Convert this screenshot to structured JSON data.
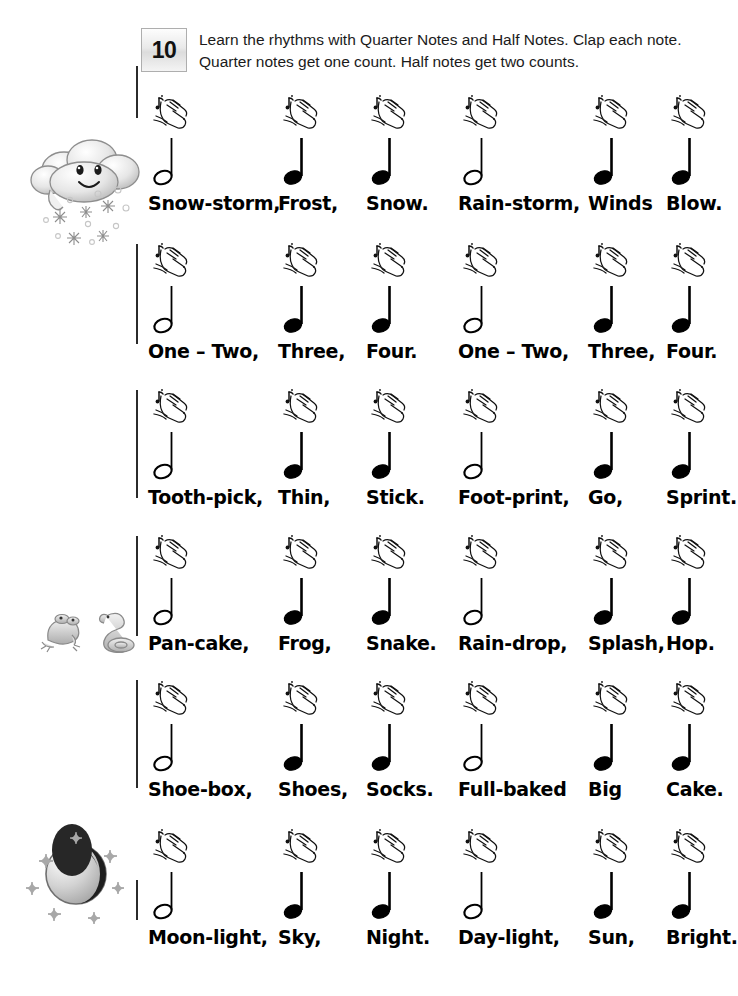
{
  "exercise": {
    "number": "10",
    "instructions": "Learn the rhythms with Quarter Notes and Half Notes. Clap each note. Quarter notes get one count. Half notes get two counts."
  },
  "icons": {
    "clap": "clapping-hands-icon",
    "half_note": "half-note-icon",
    "quarter_note": "quarter-note-icon",
    "cloud": "snow-cloud-icon",
    "frog": "frog-icon",
    "snake": "snake-icon",
    "moon": "moon-stars-icon"
  },
  "colors": {
    "ink": "#000000",
    "badge_border": "#aeaeae",
    "barline": "#2b2b2b",
    "illustration_gray": "#9a9a9a"
  },
  "rhythm_rows": [
    {
      "id": "row-1",
      "decoration": "snow-cloud-icon",
      "notes": [
        {
          "type": "half",
          "lyric": "Snow-storm,",
          "x": 0
        },
        {
          "type": "quarter",
          "lyric": "Frost,",
          "x": 130
        },
        {
          "type": "quarter",
          "lyric": "Snow.",
          "x": 218
        },
        {
          "type": "half",
          "lyric": "Rain-storm,",
          "x": 310
        },
        {
          "type": "quarter",
          "lyric": "Winds",
          "x": 440
        },
        {
          "type": "quarter",
          "lyric": "Blow.",
          "x": 518
        }
      ]
    },
    {
      "id": "row-2",
      "decoration": null,
      "notes": [
        {
          "type": "half",
          "lyric": "One – Two,",
          "x": 0
        },
        {
          "type": "quarter",
          "lyric": "Three,",
          "x": 130
        },
        {
          "type": "quarter",
          "lyric": "Four.",
          "x": 218
        },
        {
          "type": "half",
          "lyric": "One – Two,",
          "x": 310
        },
        {
          "type": "quarter",
          "lyric": "Three,",
          "x": 440
        },
        {
          "type": "quarter",
          "lyric": "Four.",
          "x": 518
        }
      ]
    },
    {
      "id": "row-3",
      "decoration": null,
      "notes": [
        {
          "type": "half",
          "lyric": "Tooth-pick,",
          "x": 0
        },
        {
          "type": "quarter",
          "lyric": "Thin,",
          "x": 130
        },
        {
          "type": "quarter",
          "lyric": "Stick.",
          "x": 218
        },
        {
          "type": "half",
          "lyric": "Foot-print,",
          "x": 310
        },
        {
          "type": "quarter",
          "lyric": "Go,",
          "x": 440
        },
        {
          "type": "quarter",
          "lyric": "Sprint.",
          "x": 518
        }
      ]
    },
    {
      "id": "row-4",
      "decoration": "frog-snake-icon",
      "notes": [
        {
          "type": "half",
          "lyric": "Pan-cake,",
          "x": 0
        },
        {
          "type": "quarter",
          "lyric": "Frog,",
          "x": 130
        },
        {
          "type": "quarter",
          "lyric": "Snake.",
          "x": 218
        },
        {
          "type": "half",
          "lyric": "Rain-drop,",
          "x": 310
        },
        {
          "type": "quarter",
          "lyric": "Splash,",
          "x": 440
        },
        {
          "type": "quarter",
          "lyric": "Hop.",
          "x": 518
        }
      ]
    },
    {
      "id": "row-5",
      "decoration": null,
      "notes": [
        {
          "type": "half",
          "lyric": "Shoe-box,",
          "x": 0
        },
        {
          "type": "quarter",
          "lyric": "Shoes,",
          "x": 130
        },
        {
          "type": "quarter",
          "lyric": "Socks.",
          "x": 218
        },
        {
          "type": "half",
          "lyric": "Full-baked",
          "x": 310
        },
        {
          "type": "quarter",
          "lyric": "Big",
          "x": 440
        },
        {
          "type": "quarter",
          "lyric": "Cake.",
          "x": 518
        }
      ]
    },
    {
      "id": "row-6",
      "decoration": "moon-stars-icon",
      "notes": [
        {
          "type": "half",
          "lyric": "Moon-light,",
          "x": 0
        },
        {
          "type": "quarter",
          "lyric": "Sky,",
          "x": 130
        },
        {
          "type": "quarter",
          "lyric": "Night.",
          "x": 218
        },
        {
          "type": "half",
          "lyric": "Day-light,",
          "x": 310
        },
        {
          "type": "quarter",
          "lyric": "Sun,",
          "x": 440
        },
        {
          "type": "quarter",
          "lyric": "Bright.",
          "x": 518
        }
      ]
    }
  ]
}
